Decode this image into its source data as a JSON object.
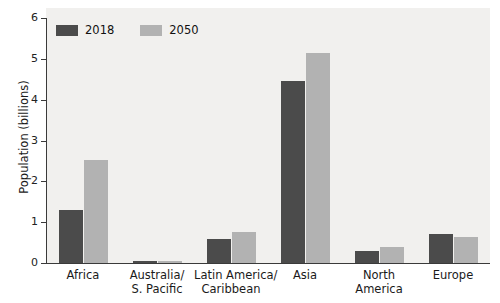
{
  "chart_data": {
    "type": "bar",
    "title": "",
    "xlabel": "",
    "ylabel": "Population (billions)",
    "ylim": [
      0,
      6
    ],
    "yticks": [
      0,
      1,
      2,
      3,
      4,
      5,
      6
    ],
    "ytick_labels": [
      "0",
      "1",
      "2",
      "3",
      "4",
      "5",
      "6"
    ],
    "grid": false,
    "legend_position": "top-left",
    "categories": [
      "Africa",
      "Australia/ S. Pacific",
      "Latin America/ Caribbean",
      "Asia",
      "North America",
      "Europe"
    ],
    "category_lines": [
      [
        "Africa"
      ],
      [
        "Australia/",
        "S. Pacific"
      ],
      [
        "Latin America/",
        "Caribbean"
      ],
      [
        "Asia"
      ],
      [
        "North",
        "America"
      ],
      [
        "Europe"
      ]
    ],
    "series": [
      {
        "name": "2018",
        "color": "#4b4b4b",
        "values": [
          1.3,
          0.04,
          0.59,
          4.45,
          0.3,
          0.71
        ]
      },
      {
        "name": "2050",
        "color": "#b2b2b2",
        "values": [
          2.52,
          0.06,
          0.76,
          5.15,
          0.4,
          0.64
        ]
      }
    ]
  },
  "legend": {
    "items": [
      {
        "label": "2018",
        "color": "#4b4b4b"
      },
      {
        "label": "2050",
        "color": "#b2b2b2"
      }
    ]
  },
  "colors": {
    "series_2018": "#4b4b4b",
    "series_2050": "#b2b2b2",
    "plot_background": "#f1f0ee",
    "axis": "#3a3a3a",
    "text": "#1a1a1a"
  }
}
